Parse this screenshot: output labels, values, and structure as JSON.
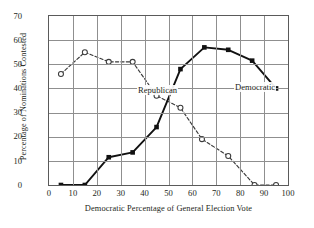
{
  "chart_data": {
    "type": "line",
    "title": "",
    "xlabel": "Democratic Percentage of General Election Vote",
    "ylabel": "Percentage of Nominations Contested",
    "xlim": [
      0,
      100
    ],
    "ylim": [
      0,
      70
    ],
    "xticks": [
      0,
      10,
      20,
      30,
      40,
      50,
      60,
      70,
      80,
      90,
      100
    ],
    "yticks": [
      0,
      10,
      20,
      30,
      40,
      50,
      60,
      70
    ],
    "grid": true,
    "legend_position": "inline-annotation",
    "series": [
      {
        "name": "Republican",
        "marker": "open-circle",
        "linestyle": "dashed",
        "color": "#3a3a3a",
        "x": [
          5,
          15,
          25,
          35,
          45,
          55,
          64,
          75,
          86,
          95
        ],
        "values": [
          46,
          55,
          51,
          51,
          37,
          32,
          19,
          12,
          0,
          0
        ]
      },
      {
        "name": "Democratic",
        "marker": "filled-square",
        "linestyle": "solid",
        "color": "#111111",
        "x": [
          5,
          15,
          25,
          35,
          45,
          55,
          65,
          75,
          85,
          95
        ],
        "values": [
          0,
          0,
          11.5,
          13.5,
          24,
          48,
          57,
          56,
          51.5,
          40
        ]
      }
    ],
    "annotations": [
      {
        "text": "Republican",
        "x": 22,
        "y": 47
      },
      {
        "text": "Democratic",
        "x": 62,
        "y": 48
      }
    ]
  }
}
